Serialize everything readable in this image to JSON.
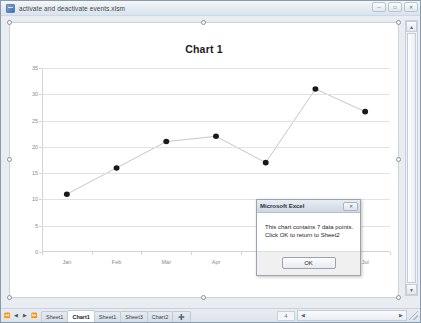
{
  "window": {
    "title": "activate and deactivate events.xlsm",
    "icon": "excel-workbook-icon",
    "buttons": [
      {
        "name": "minimize",
        "glyph": "─"
      },
      {
        "name": "maximize",
        "glyph": "□"
      },
      {
        "name": "close",
        "glyph": "✕"
      }
    ]
  },
  "chart_data": {
    "type": "line",
    "title": "Chart 1",
    "categories": [
      "Jan",
      "Feb",
      "Mar",
      "Apr",
      "May",
      "Jun",
      "Jul"
    ],
    "values": [
      11,
      16,
      21,
      22,
      17,
      31,
      26.7
    ],
    "series": [
      {
        "name": "Series1",
        "values": [
          11,
          16,
          21,
          22,
          17,
          31,
          26.7
        ]
      }
    ],
    "xlabel": "",
    "ylabel": "",
    "ylim": [
      0,
      35
    ],
    "yticks": [
      0,
      5,
      10,
      15,
      20,
      25,
      30,
      35
    ],
    "grid": true,
    "legend": false,
    "marker": "filled-circle",
    "line_color": "#595959",
    "marker_color": "#1a1a1a"
  },
  "dialog": {
    "title": "Microsoft Excel",
    "close_glyph": "✕",
    "message_line1": "This chart contains 7 data points.",
    "message_line2": "Click OK to return to Sheet2",
    "ok_label": "OK"
  },
  "tabs": {
    "nav": [
      {
        "name": "first",
        "glyph": "⏪"
      },
      {
        "name": "prev",
        "glyph": "◀"
      },
      {
        "name": "next",
        "glyph": "▶"
      },
      {
        "name": "last",
        "glyph": "⏩"
      }
    ],
    "sheets": [
      {
        "label": "Sheet1",
        "active": false
      },
      {
        "label": "Chart1",
        "active": true
      },
      {
        "label": "Sheet1",
        "active": false
      },
      {
        "label": "Sheet3",
        "active": false
      },
      {
        "label": "Chart2",
        "active": false
      }
    ],
    "new_sheet_label": "➕"
  },
  "scroll": {
    "up_glyph": "▲",
    "down_glyph": "▼",
    "left_glyph": "◀",
    "right_glyph": "▶"
  },
  "status": {
    "cell": "4"
  }
}
